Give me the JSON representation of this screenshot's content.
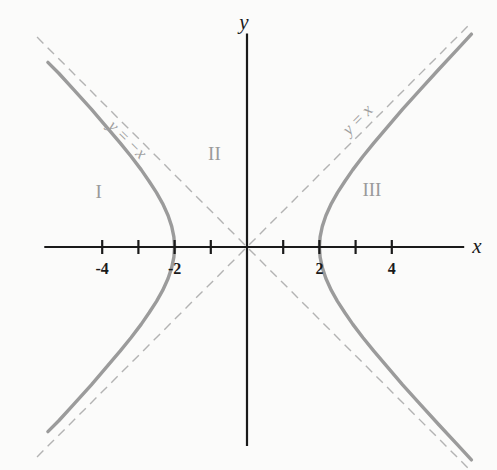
{
  "figure": {
    "background_color": "#fbfbfa",
    "width": 497,
    "height": 470
  },
  "axes": {
    "x_label": "x",
    "y_label": "y",
    "origin_px": {
      "x": 247,
      "y": 247
    },
    "px_per_unit": 36.2,
    "axis_color": "#1a1a1a",
    "x_range": [
      -5.6,
      6.0
    ],
    "y_range": [
      -5.5,
      5.9
    ]
  },
  "ticks": {
    "x": [
      {
        "value": -4,
        "label": "-4"
      },
      {
        "value": -3,
        "label": ""
      },
      {
        "value": -2,
        "label": "-2"
      },
      {
        "value": -1,
        "label": ""
      },
      {
        "value": 1,
        "label": ""
      },
      {
        "value": 2,
        "label": "2"
      },
      {
        "value": 3,
        "label": ""
      },
      {
        "value": 4,
        "label": "4"
      }
    ]
  },
  "region_labels": [
    {
      "name": "I",
      "x": -4.1,
      "y": 1.55
    },
    {
      "name": "II",
      "x": -0.9,
      "y": 2.6
    },
    {
      "name": "III",
      "x": 3.45,
      "y": 1.6
    }
  ],
  "asymptote_labels": [
    {
      "name": "y = -x",
      "text": "y = −x",
      "anchor_x": -3.6,
      "anchor_y": 3.6,
      "rotation_deg": 45
    },
    {
      "name": "y = x",
      "text": "y = x",
      "anchor_x": 2.55,
      "anchor_y": 3.35,
      "rotation_deg": -45
    }
  ],
  "colors": {
    "curve": "#9b9b9b",
    "asymptote": "#b3b3b3",
    "axis": "#1a1a1a",
    "region_text": "#9a9a9a"
  },
  "chart_data": {
    "type": "line",
    "title": "",
    "subtitle": "",
    "xlabel": "x",
    "ylabel": "y",
    "xlim": [
      -5.6,
      6.0
    ],
    "ylim": [
      -5.5,
      5.9
    ],
    "grid": false,
    "legend": "none",
    "annotations": [
      "I",
      "II",
      "III",
      "y = −x",
      "y = x"
    ],
    "equation": "x^2 - y^2 = 4",
    "curve_family": "hyperbola",
    "semi_axis_a": 2,
    "semi_axis_b": 2,
    "vertices": [
      [
        -2,
        0
      ],
      [
        2,
        0
      ]
    ],
    "asymptote_slopes": [
      1,
      -1
    ],
    "series": [
      {
        "name": "right-branch-upper",
        "points": [
          [
            2,
            0
          ],
          [
            2.02,
            0.28
          ],
          [
            2.08,
            0.57
          ],
          [
            2.18,
            0.87
          ],
          [
            2.33,
            1.2
          ],
          [
            2.5,
            1.5
          ],
          [
            2.7,
            1.81
          ],
          [
            2.92,
            2.13
          ],
          [
            3.2,
            2.5
          ],
          [
            3.5,
            2.87
          ],
          [
            3.9,
            3.34
          ],
          [
            4.3,
            3.81
          ],
          [
            4.8,
            4.36
          ],
          [
            5.3,
            4.91
          ],
          [
            5.85,
            5.5
          ],
          [
            6.2,
            5.88
          ]
        ]
      },
      {
        "name": "right-branch-lower",
        "points": [
          [
            2,
            0
          ],
          [
            2.02,
            -0.28
          ],
          [
            2.08,
            -0.57
          ],
          [
            2.18,
            -0.87
          ],
          [
            2.33,
            -1.2
          ],
          [
            2.5,
            -1.5
          ],
          [
            2.7,
            -1.81
          ],
          [
            2.92,
            -2.13
          ],
          [
            3.2,
            -2.5
          ],
          [
            3.5,
            -2.87
          ],
          [
            3.9,
            -3.34
          ],
          [
            4.3,
            -3.81
          ],
          [
            4.8,
            -4.36
          ],
          [
            5.3,
            -4.91
          ],
          [
            5.85,
            -5.5
          ],
          [
            6.2,
            -5.88
          ]
        ]
      },
      {
        "name": "left-branch-upper",
        "points": [
          [
            -2,
            0
          ],
          [
            -2.02,
            0.28
          ],
          [
            -2.08,
            0.57
          ],
          [
            -2.18,
            0.87
          ],
          [
            -2.33,
            1.2
          ],
          [
            -2.5,
            1.5
          ],
          [
            -2.7,
            1.81
          ],
          [
            -2.92,
            2.13
          ],
          [
            -3.2,
            2.5
          ],
          [
            -3.5,
            2.87
          ],
          [
            -3.9,
            3.34
          ],
          [
            -4.3,
            3.81
          ],
          [
            -4.8,
            4.36
          ],
          [
            -5.2,
            4.8
          ],
          [
            -5.5,
            5.1
          ]
        ]
      },
      {
        "name": "left-branch-lower",
        "points": [
          [
            -2,
            0
          ],
          [
            -2.02,
            -0.28
          ],
          [
            -2.08,
            -0.57
          ],
          [
            -2.18,
            -0.87
          ],
          [
            -2.33,
            -1.2
          ],
          [
            -2.5,
            -1.5
          ],
          [
            -2.7,
            -1.81
          ],
          [
            -2.92,
            -2.13
          ],
          [
            -3.2,
            -2.5
          ],
          [
            -3.5,
            -2.87
          ],
          [
            -3.9,
            -3.34
          ],
          [
            -4.3,
            -3.81
          ],
          [
            -4.8,
            -4.36
          ],
          [
            -5.2,
            -4.8
          ],
          [
            -5.5,
            -5.1
          ]
        ]
      },
      {
        "name": "asymptote-y-equals-x",
        "style": "dashed",
        "points": [
          [
            -5.8,
            -5.8
          ],
          [
            6.1,
            6.1
          ]
        ]
      },
      {
        "name": "asymptote-y-equals-minus-x",
        "style": "dashed",
        "points": [
          [
            -5.8,
            5.8
          ],
          [
            6.1,
            -6.1
          ]
        ]
      }
    ]
  }
}
